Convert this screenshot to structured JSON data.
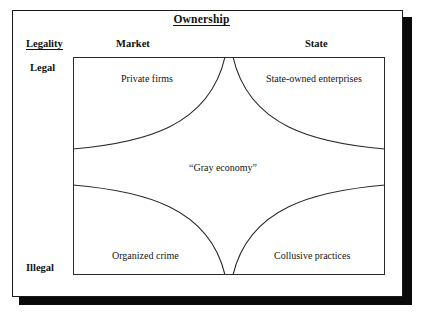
{
  "figure": {
    "column_axis_title": "Ownership",
    "row_axis_title": "Legality",
    "columns": [
      {
        "id": "market",
        "label": "Market"
      },
      {
        "id": "state",
        "label": "State"
      }
    ],
    "rows": [
      {
        "id": "legal",
        "label": "Legal"
      },
      {
        "id": "illegal",
        "label": "Illegal"
      }
    ],
    "cells": [
      {
        "id": "private-firms",
        "label": "Private firms",
        "row": "legal",
        "column": "market"
      },
      {
        "id": "state-owned-enterprises",
        "label": "State-owned enterprises",
        "row": "legal",
        "column": "state"
      },
      {
        "id": "organized-crime",
        "label": "Organized crime",
        "row": "illegal",
        "column": "market"
      },
      {
        "id": "collusive-practices",
        "label": "Collusive practices",
        "row": "illegal",
        "column": "state"
      }
    ],
    "center_region": {
      "id": "gray-economy",
      "label": "“Gray economy”"
    },
    "colors": {
      "ink": "#111111",
      "frame": "#1a1a1a",
      "shadow": "#0a0a0a",
      "curve": "#2a2a2a",
      "background": "#ffffff"
    }
  }
}
